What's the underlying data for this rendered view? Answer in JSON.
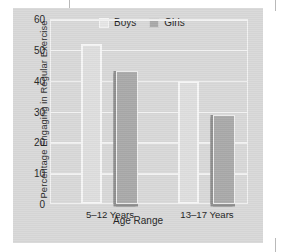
{
  "chart_data": {
    "type": "bar",
    "title": "",
    "xlabel": "Age Range",
    "ylabel": "Percentage Engaging in Regular Exercise",
    "categories": [
      "5–12 Years",
      "13–17 Years"
    ],
    "series": [
      {
        "name": "Boys",
        "values": [
          52,
          40
        ],
        "color": "#dedede"
      },
      {
        "name": "Girls",
        "values": [
          43,
          29
        ],
        "color": "#a9a9a9"
      }
    ],
    "ylim": [
      0,
      60
    ],
    "yticks": [
      "0",
      "10",
      "20",
      "30",
      "40",
      "50",
      "60"
    ],
    "ytick_values": [
      0,
      10,
      20,
      30,
      40,
      50,
      60
    ],
    "grid": true,
    "grid_color": "#f2f2f2",
    "legend_position": "top-center",
    "panel_color": "#d8d8d8",
    "background_color": "#ffffff"
  },
  "legend": {
    "items": [
      {
        "label": "Boys",
        "swatch": "legend-swatch-boys"
      },
      {
        "label": "Girls",
        "swatch": "legend-swatch-girls"
      }
    ]
  }
}
